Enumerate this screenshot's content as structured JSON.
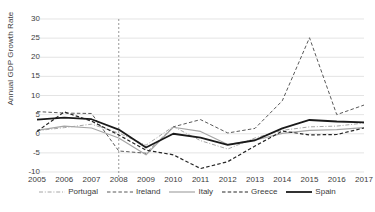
{
  "chart_data": {
    "type": "line",
    "title": "",
    "xlabel": "",
    "ylabel": "Annual GDP Growth Rate",
    "x": [
      2005,
      2006,
      2007,
      2008,
      2009,
      2010,
      2011,
      2012,
      2013,
      2014,
      2015,
      2016,
      2017
    ],
    "xtick_labels": [
      "2005",
      "2006",
      "2007",
      "2008",
      "2009",
      "2010",
      "2011",
      "2012",
      "2013",
      "2014",
      "2015",
      "2016",
      "2017"
    ],
    "ytick_labels": [
      "30",
      "25",
      "20",
      "15",
      "10",
      "5",
      "0",
      "-5",
      "-10"
    ],
    "yticks": [
      30,
      25,
      20,
      15,
      10,
      5,
      0,
      -5,
      -10
    ],
    "ylim": [
      -10,
      30
    ],
    "xlim": [
      2005,
      2017
    ],
    "grid": "horizontal",
    "legend_position": "bottom",
    "annotations": [
      {
        "name": "crisis-marker",
        "type": "vertical-line",
        "x": 2008,
        "style": "dashed",
        "color": "#7f7f7f"
      }
    ],
    "series": [
      {
        "name": "Portugal",
        "style": "dash-dot",
        "color": "#a6a6a6",
        "width": 1,
        "values": [
          0.8,
          1.6,
          2.5,
          0.2,
          -3.0,
          1.9,
          -1.8,
          -4.0,
          -1.1,
          0.9,
          1.8,
          2.0,
          2.8
        ]
      },
      {
        "name": "Ireland",
        "style": "dashed",
        "color": "#595959",
        "width": 1,
        "values": [
          5.8,
          5.4,
          5.3,
          -4.5,
          -5.1,
          1.8,
          3.7,
          0.2,
          1.4,
          8.6,
          25.1,
          5.0,
          7.5
        ]
      },
      {
        "name": "Italy",
        "style": "solid",
        "color": "#a6a6a6",
        "width": 1.2,
        "values": [
          0.9,
          2.0,
          1.5,
          -1.1,
          -5.5,
          1.7,
          0.6,
          -2.8,
          -1.7,
          0.1,
          0.9,
          1.1,
          1.6
        ]
      },
      {
        "name": "Greece",
        "style": "dashed",
        "color": "#262626",
        "width": 1.2,
        "values": [
          0.6,
          5.7,
          3.3,
          -0.3,
          -4.3,
          -5.5,
          -9.1,
          -7.3,
          -3.2,
          0.7,
          -0.3,
          -0.2,
          1.5
        ]
      },
      {
        "name": "Spain",
        "style": "solid",
        "color": "#1a1a1a",
        "width": 1.8,
        "values": [
          3.7,
          4.2,
          3.8,
          1.1,
          -3.6,
          0.0,
          -1.0,
          -2.9,
          -1.7,
          1.4,
          3.6,
          3.2,
          3.0
        ]
      }
    ]
  }
}
